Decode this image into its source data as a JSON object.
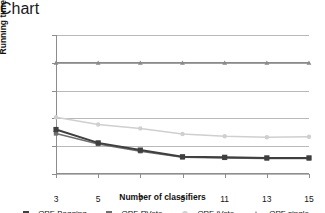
{
  "chart_data": {
    "type": "line",
    "title": "",
    "xlabel": "Number of classifiers",
    "ylabel": "Running time (sec.)",
    "x": [
      3,
      5,
      7,
      9,
      11,
      13,
      15
    ],
    "xticklabels": [
      "3",
      "5",
      "7",
      "9",
      "11",
      "13",
      "15"
    ],
    "yticklabels": [
      "1.00",
      "1.25",
      "1.50",
      "1.75",
      "2.00",
      "2.25"
    ],
    "yticks": [
      1.0,
      1.25,
      1.5,
      1.75,
      2.0,
      2.25
    ],
    "ylim": [
      1.0,
      2.25
    ],
    "xlim": [
      3,
      15
    ],
    "grid": "horizontal",
    "legend_position": "bottom",
    "series": [
      {
        "name": "OPF-Bagging",
        "color": "#3f3f3f",
        "marker": "square",
        "values": [
          1.4,
          1.28,
          1.215,
          1.155,
          1.15,
          1.145,
          1.145
        ]
      },
      {
        "name": "OPF-RVote",
        "color": "#6e6e6e",
        "marker": "square",
        "values": [
          1.365,
          1.27,
          1.205,
          1.15,
          1.145,
          1.14,
          1.14
        ]
      },
      {
        "name": "OPF-iVote",
        "color": "#cfcfcf",
        "marker": "circle",
        "values": [
          1.51,
          1.445,
          1.41,
          1.36,
          1.34,
          1.33,
          1.335
        ]
      },
      {
        "name": "OPF single",
        "color": "#8a8a8a",
        "marker": "triangle",
        "values": [
          2.0,
          2.0,
          2.0,
          2.0,
          2.0,
          2.0,
          2.0
        ]
      }
    ]
  }
}
